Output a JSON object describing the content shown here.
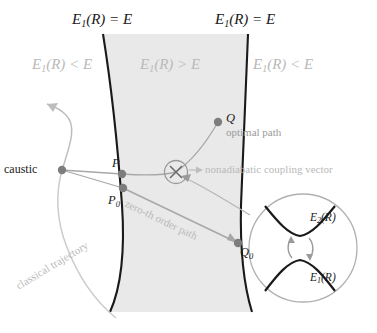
{
  "figure": {
    "name": "nonadiabatic-tunneling-diagram",
    "colors": {
      "band_fill": "#e9e9e9",
      "boundary_stroke": "#1a1a1a",
      "dark_text": "#1a1a1a",
      "gray_text": "#b9b9b9",
      "mid_gray_text": "#9a9a9a",
      "path_line": "#9a9a9a",
      "marker_dot": "#8c8c8c",
      "inset_stroke": "#aaaaaa",
      "inset_curve": "#1a1a1a"
    }
  },
  "region_labels": {
    "top_left_equation": {
      "base": "E",
      "sub": "1",
      "rest": "(R) = E"
    },
    "top_right_equation": {
      "base": "E",
      "sub": "1",
      "rest": "(R) = E"
    },
    "left_region": {
      "base": "E",
      "sub": "1",
      "rest": "(R) < E"
    },
    "center_region": {
      "base": "E",
      "sub": "1",
      "rest": "(R) > E"
    },
    "right_region": {
      "base": "E",
      "sub": "1",
      "rest": "(R) < E"
    }
  },
  "points": {
    "caustic_label": "caustic",
    "p": "P",
    "p0": {
      "base": "P",
      "sub": "0"
    },
    "q": "Q",
    "q0": {
      "base": "Q",
      "sub": "0"
    }
  },
  "annotations": {
    "optimal_path": "optimal path",
    "nonadiabatic_coupling_vector": "nonadiabatic coupling vector",
    "classical_trajectory": "classical trajectory",
    "zeroth_order_path": "zero-th order path"
  },
  "inset": {
    "upper_curve_label": {
      "base": "E",
      "sub": "2",
      "rest": "(R)"
    },
    "lower_curve_label": {
      "base": "E",
      "sub": "1",
      "rest": "(R)"
    }
  }
}
